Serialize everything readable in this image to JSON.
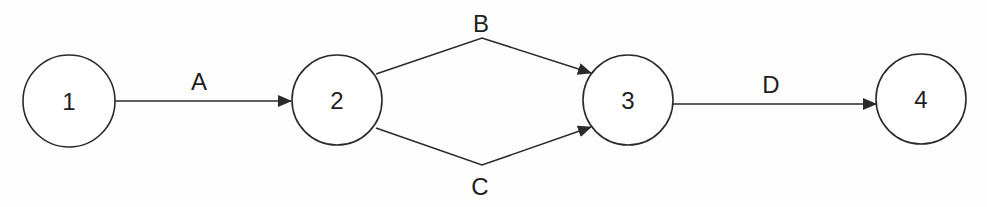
{
  "diagram": {
    "type": "activity-on-arrow network",
    "stroke_color": "#2a2a2a",
    "background": "#fdfdfd",
    "nodes": [
      {
        "id": "1",
        "label": "1",
        "cx": 69,
        "cy": 101,
        "r": 46
      },
      {
        "id": "2",
        "label": "2",
        "cx": 337,
        "cy": 100,
        "r": 45
      },
      {
        "id": "3",
        "label": "3",
        "cx": 628,
        "cy": 100,
        "r": 45
      },
      {
        "id": "4",
        "label": "4",
        "cx": 921,
        "cy": 99,
        "r": 45
      }
    ],
    "edges": [
      {
        "id": "A",
        "label": "A",
        "from": "1",
        "to": "2",
        "points": "115,101 291,101",
        "label_x": 199,
        "label_y": 90
      },
      {
        "id": "B",
        "label": "B",
        "from": "2",
        "to": "3",
        "points": "376,74 482,38 591,73",
        "label_x": 481,
        "label_y": 32
      },
      {
        "id": "C",
        "label": "C",
        "from": "2",
        "to": "3",
        "points": "376,128 482,165 591,127",
        "label_x": 480,
        "label_y": 195
      },
      {
        "id": "D",
        "label": "D",
        "from": "3",
        "to": "4",
        "points": "673,104 876,104",
        "label_x": 771,
        "label_y": 93
      }
    ]
  }
}
